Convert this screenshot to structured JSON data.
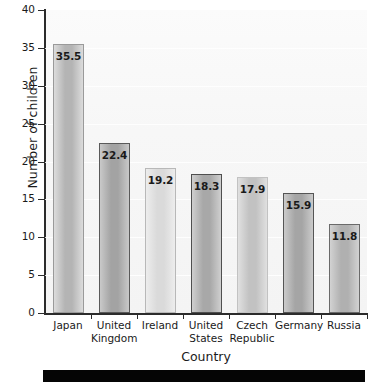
{
  "chart_data": {
    "type": "bar",
    "title": "",
    "xlabel": "Country",
    "ylabel": "Number of children",
    "categories": [
      "Japan",
      "United Kingdom",
      "Ireland",
      "United States",
      "Czech Republic",
      "Germany",
      "Russia"
    ],
    "category_lines": [
      [
        "Japan"
      ],
      [
        "United",
        "Kingdom"
      ],
      [
        "Ireland"
      ],
      [
        "United",
        "States"
      ],
      [
        "Czech",
        "Republic"
      ],
      [
        "Germany"
      ],
      [
        "Russia"
      ]
    ],
    "values": [
      35.5,
      22.4,
      19.2,
      18.3,
      17.9,
      15.9,
      11.8
    ],
    "value_labels": [
      "35.5",
      "22.4",
      "19.2",
      "18.3",
      "17.9",
      "15.9",
      "11.8"
    ],
    "ylim": [
      0,
      40
    ],
    "ytick_values": [
      0,
      5,
      10,
      15,
      20,
      25,
      30,
      35,
      40
    ],
    "ytick_labels": [
      "0",
      "5",
      "10",
      "15",
      "20",
      "25",
      "30",
      "35",
      "40"
    ],
    "grid": true,
    "legend": null,
    "bar_styles": [
      {
        "fill_light": "#dcdcdc",
        "fill_dark": "#b4b4b4",
        "border": "#9a9a9a"
      },
      {
        "fill_light": "#c9c9c9",
        "fill_dark": "#a3a3a3",
        "border": "#5a5a5a"
      },
      {
        "fill_light": "#ededed",
        "fill_dark": "#dadada",
        "border": "#b8b8b8"
      },
      {
        "fill_light": "#cfcfcf",
        "fill_dark": "#a8a8a8",
        "border": "#4f4f4f"
      },
      {
        "fill_light": "#e0e0e0",
        "fill_dark": "#c2c2c2",
        "border": "#c2c2c2"
      },
      {
        "fill_light": "#cbcbcb",
        "fill_dark": "#a5a5a5",
        "border": "#555555"
      },
      {
        "fill_light": "#d2d2d2",
        "fill_dark": "#b0b0b0",
        "border": "#6a6a6a"
      }
    ],
    "colors": {
      "axis": "#2b2b2b",
      "text": "#1a1a1a",
      "plot_background": "#f7f7f7",
      "grid": "#ffffff",
      "footer": "#050505"
    }
  }
}
